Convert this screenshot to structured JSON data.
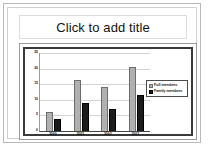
{
  "slide": {
    "title_placeholder": "Click to add title"
  },
  "chart_data": {
    "type": "bar",
    "title": "",
    "xlabel": "",
    "ylabel": "",
    "categories": [
      "2000",
      "2001",
      "2002",
      "2003"
    ],
    "series": [
      {
        "name": "Full members",
        "values": [
          6,
          16.5,
          14,
          20.5
        ],
        "color": "#b0b0b0"
      },
      {
        "name": "Family members",
        "values": [
          4,
          9,
          7,
          11.5
        ],
        "color": "#1b1b1b"
      }
    ],
    "ylim": [
      0,
      25
    ],
    "yticks": [
      "25",
      "20",
      "15",
      "10",
      "5",
      "0"
    ],
    "grid": true,
    "legend_position": "right"
  },
  "legend": {
    "items": [
      {
        "label": "Full members"
      },
      {
        "label": "Family members"
      }
    ]
  }
}
